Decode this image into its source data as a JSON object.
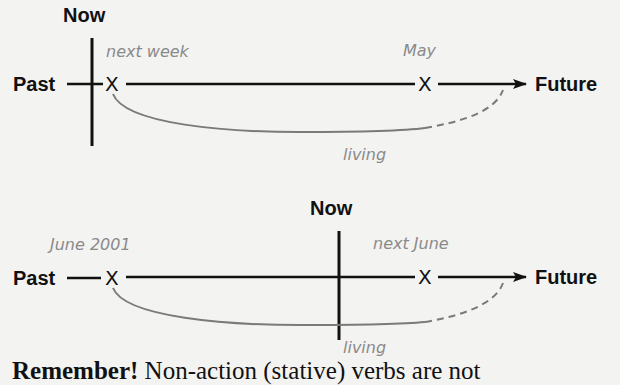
{
  "diagrams": [
    {
      "now_label": "Now",
      "past_label": "Past",
      "future_label": "Future",
      "point_marker": "X",
      "event1_label": "next week",
      "event2_label": "May",
      "span_label": "living"
    },
    {
      "now_label": "Now",
      "past_label": "Past",
      "future_label": "Future",
      "point_marker": "X",
      "event1_label": "June 2001",
      "event2_label": "next June",
      "span_label": "living"
    }
  ],
  "footer": {
    "emphasis": "Remember!",
    "text": " Non-action (stative) verbs are not"
  },
  "colors": {
    "background": "#f3f3f2",
    "timeline": "#111111",
    "span_curve": "#7a7a7a",
    "handwritten_text": "#8a8a8a"
  }
}
